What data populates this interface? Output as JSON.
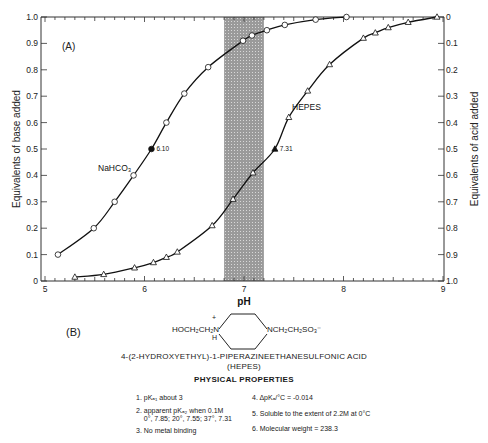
{
  "chart_data": {
    "type": "line",
    "title": "",
    "panel_label": "(A)",
    "xlabel": "pH",
    "ylabel": "Equivalents of base added",
    "ylabel_right": "Equivalents of acid added",
    "xlim": [
      5,
      9
    ],
    "ylim": [
      0,
      1.0
    ],
    "ylim_right": [
      1.0,
      0
    ],
    "x_ticks": [
      "5",
      "6",
      "7",
      "8",
      "9"
    ],
    "y_ticks": [
      "0",
      "0.1",
      "0.2",
      "0.3",
      "0.4",
      "0.5",
      "0.6",
      "0.7",
      "0.8",
      "0.9",
      "1.0"
    ],
    "y_ticks_right": [
      "0",
      "0.1",
      "0.2",
      "0.3",
      "0.4",
      "0.5",
      "0.6",
      "0.7",
      "0.8",
      "0.9",
      "1.0"
    ],
    "grid": false,
    "shaded_band": {
      "x_from": 6.8,
      "x_to": 7.2,
      "fill": "#9a9a9a"
    },
    "series": [
      {
        "name": "NaHCO3",
        "marker": "circle",
        "x": [
          5.13,
          5.49,
          5.7,
          5.89,
          6.07,
          6.22,
          6.4,
          6.64,
          6.99,
          7.08,
          7.23,
          7.41,
          7.72,
          8.03
        ],
        "values": [
          0.1,
          0.2,
          0.3,
          0.4,
          0.5,
          0.6,
          0.71,
          0.81,
          0.91,
          0.93,
          0.95,
          0.97,
          0.99,
          1.0
        ],
        "highlight": {
          "x": 6.07,
          "y": 0.5,
          "label": "6.10"
        }
      },
      {
        "name": "HEPES",
        "marker": "triangle",
        "x": [
          5.3,
          5.59,
          5.9,
          6.09,
          6.22,
          6.33,
          6.68,
          6.89,
          7.09,
          7.31,
          7.45,
          7.64,
          7.86,
          8.2,
          8.32,
          8.45,
          8.65,
          8.94
        ],
        "values": [
          0.015,
          0.025,
          0.05,
          0.07,
          0.09,
          0.11,
          0.21,
          0.31,
          0.41,
          0.5,
          0.62,
          0.72,
          0.82,
          0.92,
          0.94,
          0.96,
          0.98,
          1.0
        ],
        "highlight": {
          "x": 7.31,
          "y": 0.5,
          "label": "7.31"
        }
      }
    ]
  },
  "panel_b": {
    "label": "(B)",
    "structure_left": "HOCH₂CH₂N",
    "structure_plus": "+",
    "structure_h": "H",
    "structure_right": "NCH₂CH₂SO₃⁻",
    "name": "4-(2-HYDROXYETHYL)-1-PIPERAZINEETHANESULFONIC ACID",
    "abbrev": "(HEPES)",
    "properties_title": "PHYSICAL PROPERTIES",
    "properties": [
      "1. pKₐ₁ about 3",
      "2. apparent pKₐ₂ when 0.1M\n    0°, 7.85; 20°, 7.55; 37°, 7.31",
      "3. No metal binding",
      "4. ΔpKₐ/°C = -0.014",
      "5. Soluble to the extent of 2.2M at 0°C",
      "6. Molecular weight = 238.3"
    ]
  }
}
